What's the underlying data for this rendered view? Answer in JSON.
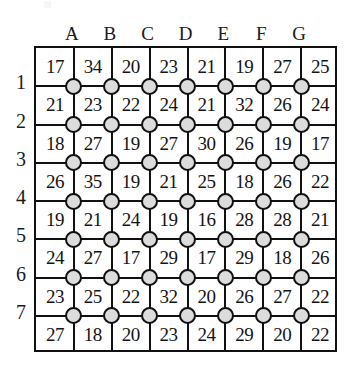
{
  "puzzle": {
    "title": "numbered grid puzzle",
    "column_headers": [
      "A",
      "B",
      "C",
      "D",
      "E",
      "F",
      "G"
    ],
    "row_labels": [
      "1",
      "2",
      "3",
      "4",
      "5",
      "6",
      "7"
    ],
    "grid_rows": 8,
    "grid_cols": 8,
    "node_rows": 7,
    "node_cols": 7,
    "colors": {
      "line": "#111111",
      "node_fill": "#dcdcdc",
      "node_stroke": "#111111",
      "text": "#141414",
      "background": "#ffffff"
    },
    "values": [
      [
        17,
        34,
        20,
        23,
        21,
        19,
        27,
        25
      ],
      [
        21,
        23,
        22,
        24,
        21,
        32,
        26,
        24
      ],
      [
        18,
        27,
        19,
        27,
        30,
        26,
        19,
        17
      ],
      [
        26,
        35,
        19,
        21,
        25,
        18,
        26,
        22
      ],
      [
        19,
        21,
        24,
        19,
        16,
        28,
        28,
        21
      ],
      [
        24,
        27,
        17,
        29,
        17,
        29,
        18,
        26
      ],
      [
        23,
        25,
        22,
        32,
        20,
        26,
        27,
        22
      ],
      [
        27,
        18,
        20,
        23,
        24,
        29,
        20,
        22
      ]
    ]
  }
}
